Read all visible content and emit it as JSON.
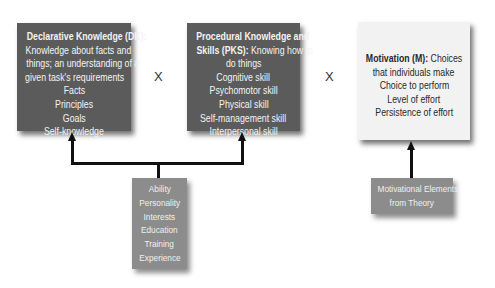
{
  "boxes": {
    "dk": {
      "title": "Declarative Knowledge (DK):",
      "lines": [
        "Knowledge about facts and",
        "things; an understanding of a",
        "given task's requirements",
        "Facts",
        "Principles",
        "Goals",
        "Self-knowledge"
      ]
    },
    "pks": {
      "title_line1": "Procedural Knowledge and",
      "title_bold2": "Skills (PKS):",
      "title_rest2": " Knowing how to",
      "lines": [
        "do things",
        "Cognitive skill",
        "Psychomotor skill",
        "Physical skill",
        "Self-management skill",
        "Interpersonal skill"
      ]
    },
    "motivation": {
      "title": "Motivation (M):",
      "title_rest": " Choices",
      "lines": [
        "that individuals make",
        "Choice to perform",
        "Level of effort",
        "Persistence of effort"
      ]
    },
    "determinants": {
      "lines": [
        "Ability",
        "Personality",
        "Interests",
        "Education",
        "Training",
        "Experience"
      ]
    },
    "motivational_elements": {
      "lines": [
        "Motivational Elements",
        "from Theory"
      ]
    }
  },
  "operators": [
    "X",
    "X"
  ],
  "colors": {
    "dark_box": "#5b5b5b",
    "light_box": "#f2f2f2",
    "mid_box": "#8c8c8c",
    "connector": "#111111"
  }
}
